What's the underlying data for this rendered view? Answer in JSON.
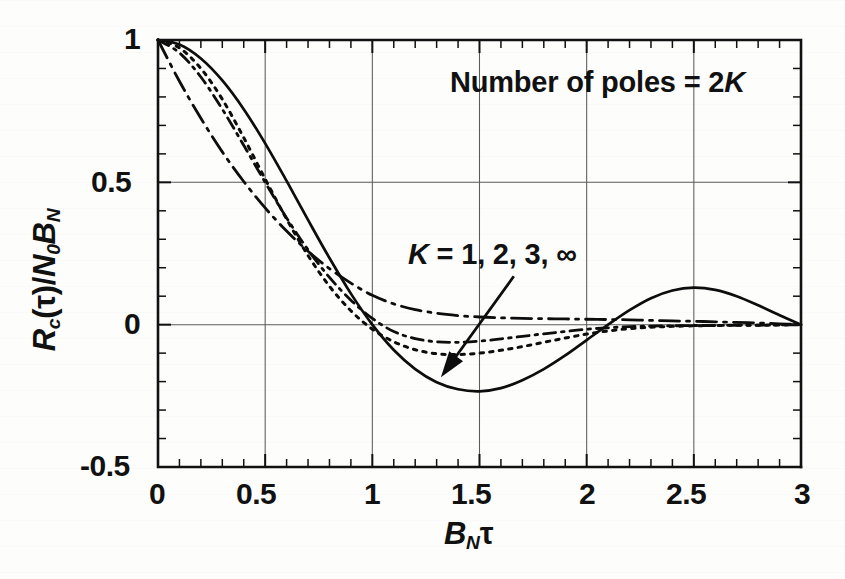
{
  "figure": {
    "background_color": "#fdfdfc",
    "ink_color": "#111111",
    "grid_color": "#5b5b5b",
    "annotation": "Number of poles = 2K",
    "annotation_prefix": "Number of poles = 2",
    "annotation_italic": "K",
    "curve_label_prefix": "K",
    "curve_label_rest": " = 1, 2, 3, ∞",
    "ylabel_r": "R",
    "ylabel_sub_c": "c",
    "ylabel_tau": "(τ)/",
    "ylabel_n": "N",
    "ylabel_sub_0": "0",
    "ylabel_b": "B",
    "ylabel_sub_n2": "N",
    "xlabel_b": "B",
    "xlabel_sub_n": "N",
    "xlabel_tau": "τ"
  },
  "chart_data": {
    "type": "line",
    "title": "Number of poles = 2K",
    "xlabel": "B_N τ",
    "ylabel": "R_c(τ)/N_0 B_N",
    "xlim": [
      0,
      3
    ],
    "ylim": [
      -0.5,
      1
    ],
    "xticks": [
      0,
      0.5,
      1,
      1.5,
      2,
      2.5,
      3
    ],
    "xtick_labels": [
      "0",
      "0.5",
      "1",
      "1.5",
      "2",
      "2.5",
      "3"
    ],
    "yticks": [
      -0.5,
      0,
      0.5,
      1
    ],
    "ytick_labels": [
      "-0.5",
      "0",
      "0.5",
      "1"
    ],
    "minor_tick_step_x": 0.1,
    "minor_tick_step_y": 0.1,
    "grid": true,
    "gridlines_x": [
      0.5,
      1,
      1.5,
      2,
      2.5
    ],
    "gridlines_y": [
      0,
      0.5
    ],
    "legend": "none",
    "annotation_text": "K = 1, 2, 3, ∞",
    "annotation_arrow": {
      "from": [
        1.66,
        0.17
      ],
      "to": [
        1.32,
        -0.185
      ]
    },
    "series": [
      {
        "name": "K = 1",
        "label": "K = 1",
        "style": "long-dash-dot",
        "x": [
          0.0,
          0.1,
          0.2,
          0.3,
          0.4,
          0.5,
          0.6,
          0.7,
          0.8,
          0.9,
          1.0,
          1.1,
          1.2,
          1.3,
          1.4,
          1.5,
          1.6,
          1.7,
          1.8,
          1.9,
          2.0,
          2.1,
          2.2,
          2.3,
          2.4,
          2.5,
          2.6,
          2.7,
          2.8,
          2.9,
          3.0
        ],
        "y": [
          1.0,
          0.855,
          0.725,
          0.607,
          0.503,
          0.41,
          0.329,
          0.258,
          0.197,
          0.146,
          0.103,
          0.073,
          0.053,
          0.04,
          0.032,
          0.027,
          0.024,
          0.022,
          0.021,
          0.02,
          0.019,
          0.018,
          0.017,
          0.015,
          0.013,
          0.012,
          0.01,
          0.008,
          0.006,
          0.003,
          0.0
        ]
      },
      {
        "name": "K = 2",
        "label": "K = 2",
        "style": "dash-dot",
        "x": [
          0.0,
          0.1,
          0.2,
          0.3,
          0.4,
          0.5,
          0.6,
          0.7,
          0.8,
          0.9,
          1.0,
          1.1,
          1.2,
          1.3,
          1.4,
          1.5,
          1.6,
          1.7,
          1.8,
          1.9,
          2.0,
          2.1,
          2.2,
          2.3,
          2.4,
          2.5,
          2.6,
          2.7,
          2.8,
          2.9,
          3.0
        ],
        "y": [
          1.0,
          0.955,
          0.87,
          0.757,
          0.63,
          0.5,
          0.375,
          0.263,
          0.166,
          0.086,
          0.022,
          -0.024,
          -0.049,
          -0.06,
          -0.062,
          -0.058,
          -0.05,
          -0.041,
          -0.032,
          -0.024,
          -0.016,
          -0.011,
          -0.007,
          -0.005,
          -0.004,
          -0.003,
          -0.003,
          -0.002,
          -0.002,
          -0.001,
          0.0
        ]
      },
      {
        "name": "K = 3",
        "label": "K = 3",
        "style": "dotted",
        "x": [
          0.0,
          0.1,
          0.2,
          0.3,
          0.4,
          0.5,
          0.6,
          0.7,
          0.8,
          0.9,
          1.0,
          1.1,
          1.2,
          1.3,
          1.4,
          1.5,
          1.6,
          1.7,
          1.8,
          1.9,
          2.0,
          2.1,
          2.2,
          2.3,
          2.4,
          2.5,
          2.6,
          2.7,
          2.8,
          2.9,
          3.0
        ],
        "y": [
          1.0,
          0.972,
          0.9,
          0.792,
          0.657,
          0.512,
          0.371,
          0.243,
          0.135,
          0.049,
          -0.016,
          -0.06,
          -0.088,
          -0.102,
          -0.105,
          -0.1,
          -0.09,
          -0.077,
          -0.062,
          -0.047,
          -0.033,
          -0.022,
          -0.014,
          -0.009,
          -0.006,
          -0.004,
          -0.003,
          -0.002,
          -0.002,
          -0.001,
          0.0
        ]
      },
      {
        "name": "K = infinity",
        "label": "K = ∞",
        "style": "solid",
        "x": [
          0.0,
          0.1,
          0.2,
          0.3,
          0.4,
          0.5,
          0.6,
          0.7,
          0.8,
          0.9,
          1.0,
          1.1,
          1.2,
          1.3,
          1.4,
          1.5,
          1.6,
          1.7,
          1.8,
          1.9,
          2.0,
          2.1,
          2.2,
          2.3,
          2.4,
          2.5,
          2.6,
          2.7,
          2.8,
          2.9,
          3.0
        ],
        "y": [
          1.0,
          0.984,
          0.935,
          0.858,
          0.757,
          0.637,
          0.505,
          0.368,
          0.234,
          0.109,
          0.0,
          -0.089,
          -0.156,
          -0.202,
          -0.227,
          -0.234,
          -0.223,
          -0.195,
          -0.156,
          -0.108,
          -0.054,
          0.0,
          0.051,
          0.093,
          0.12,
          0.13,
          0.122,
          0.1,
          0.068,
          0.033,
          0.0
        ]
      }
    ]
  }
}
